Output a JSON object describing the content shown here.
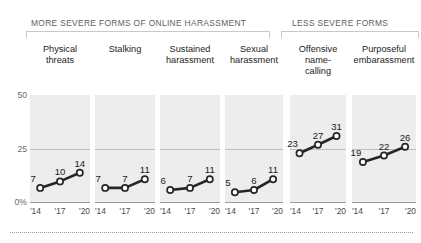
{
  "groups": [
    {
      "id": "more",
      "label": "MORE SEVERE FORMS OF ONLINE HARASSMENT"
    },
    {
      "id": "less",
      "label": "LESS SEVERE FORMS"
    }
  ],
  "axis": {
    "y_ticks": [
      "50",
      "25",
      "0%"
    ],
    "x_ticks": [
      "'14",
      "'17",
      "'20"
    ]
  },
  "panels": [
    {
      "title": "Physical\nthreats",
      "title_l1": "Physical",
      "title_l2": "threats",
      "values": [
        7,
        10,
        14
      ]
    },
    {
      "title": "Stalking",
      "title_l1": "Stalking",
      "title_l2": "",
      "values": [
        7,
        7,
        11
      ]
    },
    {
      "title": "Sustained harassment",
      "title_l1": "Sustained",
      "title_l2": "harassment",
      "values": [
        6,
        7,
        11
      ]
    },
    {
      "title": "Sexual harassment",
      "title_l1": "Sexual",
      "title_l2": "harassment",
      "values": [
        5,
        6,
        11
      ]
    },
    {
      "title": "Offensive name-calling",
      "title_l1": "Offensive",
      "title_l2": "name-",
      "title_l3": "calling",
      "values": [
        23,
        27,
        31
      ]
    },
    {
      "title": "Purposeful embarassment",
      "title_l1": "Purposeful",
      "title_l2": "embarassment",
      "values": [
        19,
        22,
        26
      ]
    }
  ],
  "chart_data": {
    "type": "line",
    "xlabel": "",
    "ylabel": "",
    "x": [
      "'14",
      "'17",
      "'20"
    ],
    "ylim": [
      0,
      50
    ],
    "y_ticks": [
      0,
      25,
      50
    ],
    "y_tick_labels": [
      "0%",
      "25",
      "50"
    ],
    "grid": true,
    "legend": "none",
    "panel_layout": "small-multiples",
    "groups": [
      {
        "name": "MORE SEVERE FORMS OF ONLINE HARASSMENT",
        "series": [
          {
            "name": "Physical threats",
            "values": [
              7,
              10,
              14
            ]
          },
          {
            "name": "Stalking",
            "values": [
              7,
              7,
              11
            ]
          },
          {
            "name": "Sustained harassment",
            "values": [
              6,
              7,
              11
            ]
          },
          {
            "name": "Sexual harassment",
            "values": [
              5,
              6,
              11
            ]
          }
        ]
      },
      {
        "name": "LESS SEVERE FORMS",
        "series": [
          {
            "name": "Offensive name-calling",
            "values": [
              23,
              27,
              31
            ]
          },
          {
            "name": "Purposeful embarassment",
            "values": [
              19,
              22,
              26
            ]
          }
        ]
      }
    ],
    "series": [
      {
        "name": "Physical threats",
        "values": [
          7,
          10,
          14
        ]
      },
      {
        "name": "Stalking",
        "values": [
          7,
          7,
          11
        ]
      },
      {
        "name": "Sustained harassment",
        "values": [
          6,
          7,
          11
        ]
      },
      {
        "name": "Sexual harassment",
        "values": [
          5,
          6,
          11
        ]
      },
      {
        "name": "Offensive name-calling",
        "values": [
          23,
          27,
          31
        ]
      },
      {
        "name": "Purposeful embarassment",
        "values": [
          19,
          22,
          26
        ]
      }
    ],
    "colors": {
      "line": "#262626",
      "marker_fill": "#ffffff",
      "panel_bg": "#ededed",
      "gridline": "#bdbdbd"
    }
  }
}
